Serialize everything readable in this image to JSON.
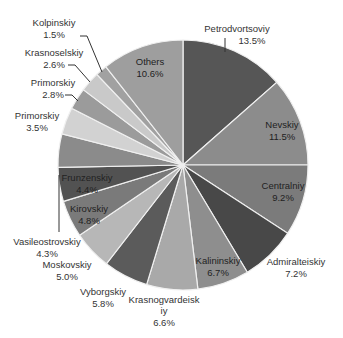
{
  "chart_data": {
    "type": "pie",
    "title": "",
    "start_angle_deg": 0,
    "direction": "clockwise",
    "center": [
      183,
      165
    ],
    "radius": 125,
    "slices": [
      {
        "label": "Petrodvortsoviy",
        "value": 13.5,
        "display": "13.5%",
        "color": "#565656",
        "label_pos": [
          237,
          28
        ],
        "pct_pos": [
          252,
          40
        ],
        "inside": false,
        "leader": [
          [
            225,
            38
          ],
          [
            225,
            52
          ]
        ]
      },
      {
        "label": "Nevskiy",
        "value": 11.5,
        "display": "11.5%",
        "color": "#8c8c8c",
        "label_pos": [
          282,
          124
        ],
        "pct_pos": [
          282,
          136
        ],
        "inside": true
      },
      {
        "label": "Centralniy",
        "value": 9.2,
        "display": "9.2%",
        "color": "#7b7b7b",
        "label_pos": [
          283,
          185
        ],
        "pct_pos": [
          283,
          197
        ],
        "inside": true
      },
      {
        "label": "Admiralteiskiy",
        "value": 7.2,
        "display": "7.2%",
        "color": "#484848",
        "label_pos": [
          296,
          261
        ],
        "pct_pos": [
          296,
          273
        ],
        "inside": false
      },
      {
        "label": "Kalininskiy",
        "value": 6.7,
        "display": "6.7%",
        "color": "#8e8e8e",
        "label_pos": [
          218,
          260
        ],
        "pct_pos": [
          218,
          272
        ],
        "inside": true
      },
      {
        "label": "Krasnogvardeiskiy",
        "value": 6.6,
        "display": "6.6%",
        "color": "#a9a9a9",
        "label_pos": [
          164,
          299
        ],
        "pct_pos": [
          164,
          322
        ],
        "label_lines": [
          "Krasnogvardeisk",
          "iy"
        ],
        "inside": false
      },
      {
        "label": "Vyborgskiy",
        "value": 5.8,
        "display": "5.8%",
        "color": "#5b5b5b",
        "label_pos": [
          103,
          291
        ],
        "pct_pos": [
          103,
          303
        ],
        "inside": false
      },
      {
        "label": "Moskovskiy",
        "value": 5.0,
        "display": "5.0%",
        "color": "#b7b7b7",
        "label_pos": [
          67,
          264
        ],
        "pct_pos": [
          67,
          276
        ],
        "inside": false
      },
      {
        "label": "Kirovskiy",
        "value": 4.8,
        "display": "4.8%",
        "color": "#7a7a7a",
        "label_pos": [
          89,
          208
        ],
        "pct_pos": [
          89,
          220
        ],
        "inside": true
      },
      {
        "label": "Frunzenskiy",
        "value": 4.4,
        "display": "4.4%",
        "color": "#525252",
        "label_pos": [
          87,
          177
        ],
        "pct_pos": [
          87,
          189
        ],
        "inside": true
      },
      {
        "label": "Vasileostrovskiy",
        "value": 4.3,
        "display": "4.3%",
        "color": "#8b8b8b",
        "label_pos": [
          47,
          241
        ],
        "pct_pos": [
          47,
          253
        ],
        "inside": false,
        "leader": [
          [
            59,
            175
          ],
          [
            59,
            232
          ]
        ]
      },
      {
        "label": "Primorskiy",
        "value": 3.5,
        "display": "3.5%",
        "color": "#d2d2d2",
        "label_pos": [
          37,
          115
        ],
        "pct_pos": [
          37,
          127
        ],
        "inside": false
      },
      {
        "label": "Primorskiy",
        "value": 2.8,
        "display": "2.8%",
        "color": "#9b9b9b",
        "label_pos": [
          53,
          82
        ],
        "pct_pos": [
          53,
          94
        ],
        "inside": false,
        "leader": [
          [
            65,
            95
          ],
          [
            72,
            95
          ],
          [
            78,
            101
          ]
        ]
      },
      {
        "label": "Krasnoselskiy",
        "value": 2.6,
        "display": "2.6%",
        "color": "#c9c9c9",
        "label_pos": [
          54,
          52
        ],
        "pct_pos": [
          54,
          64
        ],
        "inside": false,
        "leader": [
          [
            68,
            65
          ],
          [
            75,
            65
          ],
          [
            90,
            82
          ]
        ]
      },
      {
        "label": "Kolpinskiy",
        "value": 1.5,
        "display": "1.5%",
        "color": "#a1a1a1",
        "label_pos": [
          54,
          22
        ],
        "pct_pos": [
          54,
          34
        ],
        "inside": false,
        "leader": [
          [
            80,
            36
          ],
          [
            87,
            36
          ],
          [
            102,
            72
          ]
        ]
      },
      {
        "label": "Others",
        "value": 10.6,
        "display": "10.6%",
        "color": "#9e9e9e",
        "label_pos": [
          150,
          61
        ],
        "pct_pos": [
          150,
          73
        ],
        "inside": true
      }
    ],
    "legend": null,
    "separator_color": "#f0f0f0"
  }
}
